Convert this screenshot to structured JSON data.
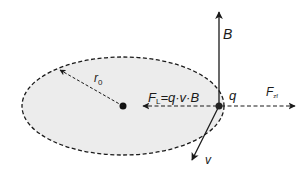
{
  "diagram": {
    "type": "physics-force-diagram",
    "colors": {
      "background": "#ffffff",
      "orbit_fill": "#ececec",
      "stroke": "#1a1a1a"
    },
    "orbit": {
      "cx": 123,
      "cy": 106,
      "rx": 101,
      "ry": 49,
      "style": "dashed"
    },
    "center_point": {
      "x": 123,
      "y": 106
    },
    "charge": {
      "x": 219,
      "y": 106,
      "label": "q"
    },
    "radius": {
      "label": "r",
      "subscript": "0",
      "from": [
        123,
        106
      ],
      "to": [
        59,
        69
      ],
      "style": "dashed"
    },
    "magnetic_field": {
      "label": "B",
      "from": [
        219,
        106
      ],
      "to": [
        219,
        12
      ],
      "style": "solid"
    },
    "lorentz_force": {
      "label": "F",
      "subscript": "L",
      "formula_rest": "=q·v·B",
      "from": [
        219,
        106
      ],
      "to": [
        143,
        106
      ],
      "style": "dashed"
    },
    "centrifugal_force": {
      "label": "F",
      "subscript": "zf",
      "from": [
        219,
        106
      ],
      "to": [
        295,
        106
      ],
      "style": "dashed"
    },
    "velocity": {
      "label": "v",
      "from": [
        219,
        106
      ],
      "to": [
        192,
        160
      ],
      "style": "solid"
    }
  }
}
